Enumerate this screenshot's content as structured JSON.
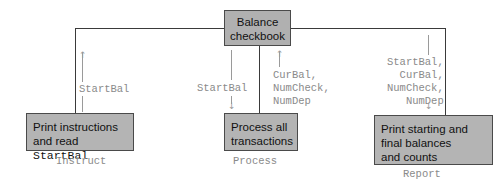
{
  "diagram": {
    "type": "structure-chart",
    "root": {
      "label_line1": "Balance",
      "label_line2": "checkbook"
    },
    "modules": [
      {
        "name": "Instruct",
        "text_line1": "Print instructions",
        "text_line2_prefix": "and read ",
        "text_line2_code": "StartBal",
        "flows_up": [
          "StartBal"
        ],
        "flows_down": []
      },
      {
        "name": "Process",
        "text_line1": "Process all",
        "text_line2": "transactions",
        "flows_down": [
          "StartBal"
        ],
        "flows_up": [
          "CurBal,",
          "NumCheck,",
          "NumDep"
        ]
      },
      {
        "name": "Report",
        "text_line1": "Print starting and",
        "text_line2": "final balances",
        "text_line3": "and counts",
        "flows_down": [
          "StartBal,",
          "CurBal,",
          "NumCheck,",
          "NumDep"
        ]
      }
    ],
    "colors": {
      "box_fill": "#b4b4b4",
      "line": "#3a3a3a",
      "flow_text": "#8a8a8a"
    }
  }
}
